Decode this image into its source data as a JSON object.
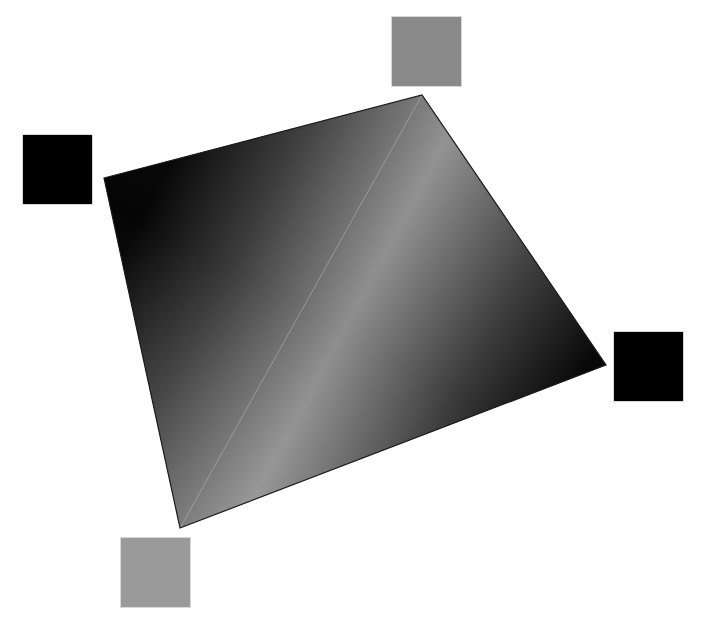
{
  "figure": {
    "description": "Bilinear color interpolation across a quadrilateral with corner color swatches",
    "background": "#ffffff",
    "quad": {
      "vertices": {
        "top_left": [
          104,
          178
        ],
        "top_right": [
          422,
          95
        ],
        "right": [
          606,
          365
        ],
        "bottom_left": [
          180,
          528
        ]
      },
      "edge_color": "#1a1a1a",
      "diagonal_highlight_color": "#9a9a9a"
    },
    "corner_swatches": [
      {
        "id": "top-left",
        "color": "#000000",
        "x": 22,
        "y": 134,
        "size": 71
      },
      {
        "id": "top-right",
        "color": "#8a8a8a",
        "x": 391,
        "y": 16,
        "size": 71
      },
      {
        "id": "right",
        "color": "#000000",
        "x": 613,
        "y": 331,
        "size": 71
      },
      {
        "id": "bottom-left",
        "color": "#9a9a9a",
        "x": 120,
        "y": 537,
        "size": 71
      }
    ]
  }
}
